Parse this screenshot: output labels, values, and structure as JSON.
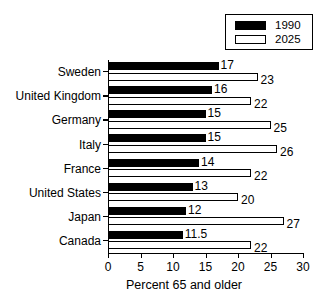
{
  "chart_data": {
    "type": "bar",
    "orientation": "horizontal",
    "title": "",
    "xlabel": "Percent 65 and older",
    "ylabel": "",
    "xlim": [
      0,
      30
    ],
    "xticks": [
      0,
      5,
      10,
      15,
      20,
      25,
      30
    ],
    "grid": false,
    "legend_position": "top-right",
    "categories": [
      "Sweden",
      "United Kingdom",
      "Germany",
      "Italy",
      "France",
      "United States",
      "Japan",
      "Canada"
    ],
    "series": [
      {
        "name": "1990",
        "color": "#000000",
        "values": [
          17,
          16,
          15,
          15,
          14,
          13,
          12,
          11.5
        ],
        "labels": [
          "17",
          "16",
          "15",
          "15",
          "14",
          "13",
          "12",
          "11.5"
        ]
      },
      {
        "name": "2025",
        "color": "#ffffff",
        "values": [
          23,
          22,
          25,
          26,
          22,
          20,
          27,
          22
        ],
        "labels": [
          "23",
          "22",
          "25",
          "26",
          "22",
          "20",
          "27",
          "22"
        ]
      }
    ]
  },
  "legend": {
    "entries": [
      {
        "label": "1990",
        "swatch": "filled-black-swatch"
      },
      {
        "label": "2025",
        "swatch": "outlined-white-swatch"
      }
    ]
  },
  "axis": {
    "x_title": "Percent 65 and older",
    "tick_labels": [
      "0",
      "5",
      "10",
      "15",
      "20",
      "25",
      "30"
    ]
  }
}
